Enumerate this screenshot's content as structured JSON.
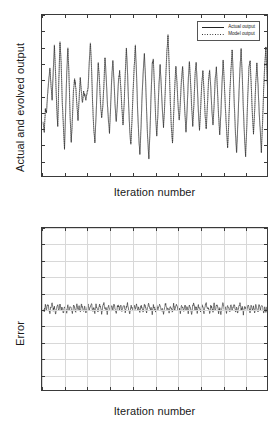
{
  "figure": {
    "background": "#ffffff",
    "axis_color": "#3a3a3a",
    "grid_color": "#d8d8d8",
    "line_color": "#222222"
  },
  "legend": {
    "entries": [
      {
        "label": "Actual output",
        "style": "solid"
      },
      {
        "label": "Model output",
        "style": "dotted"
      }
    ]
  },
  "chart_data": [
    {
      "type": "line",
      "id": "actual-vs-model",
      "title": "",
      "xlabel": "Iteration number",
      "ylabel": "Actual and evolved output",
      "xlim": [
        0,
        200
      ],
      "ylim": [
        -1,
        1
      ],
      "grid": false,
      "legend_position": "top-right",
      "xticks": [
        0,
        20,
        40,
        60,
        80,
        100,
        120,
        140,
        160,
        180,
        200
      ],
      "xtick_labels": [
        "0",
        "20",
        "40",
        "60",
        "80",
        "100",
        "120",
        "140",
        "160",
        "180",
        "200"
      ],
      "yticks": [
        1,
        0.8,
        0.6,
        0.4,
        0.2,
        0,
        -0.2,
        -0.4,
        -0.6,
        -0.8,
        -1
      ],
      "ytick_labels": [
        "1",
        "0.8",
        "0.6",
        "0.4",
        "0.2",
        "0",
        "-0.2",
        "-0.4",
        "-0.6",
        "-0.8",
        "-1"
      ],
      "series": [
        {
          "name": "Actual output",
          "style": "solid",
          "x_start": 1,
          "x_step": 1,
          "values": [
            -0.32,
            -0.46,
            -0.18,
            -0.21,
            0.02,
            0.18,
            0.35,
            0.12,
            -0.05,
            0.3,
            0.62,
            0.3,
            -0.12,
            -0.4,
            0.2,
            0.66,
            0.42,
            -0.08,
            -0.38,
            -0.66,
            -0.2,
            0.28,
            0.6,
            0.24,
            -0.26,
            -0.58,
            -0.3,
            0.06,
            0.2,
            0.1,
            -0.12,
            -0.3,
            -0.05,
            0.22,
            0.05,
            -0.1,
            0.04,
            0.0,
            -0.06,
            0.02,
            0.1,
            0.4,
            0.66,
            0.36,
            -0.1,
            -0.42,
            -0.58,
            -0.28,
            0.1,
            0.4,
            0.2,
            -0.1,
            -0.28,
            -0.14,
            0.12,
            0.48,
            0.24,
            -0.06,
            -0.3,
            -0.46,
            -0.14,
            0.22,
            0.44,
            0.18,
            -0.14,
            -0.34,
            -0.1,
            0.18,
            0.3,
            0.1,
            -0.16,
            -0.36,
            -0.12,
            0.26,
            0.58,
            0.3,
            -0.12,
            -0.44,
            -0.62,
            -0.3,
            0.06,
            0.36,
            0.62,
            0.28,
            -0.18,
            -0.52,
            -0.74,
            -0.4,
            0.0,
            0.3,
            0.52,
            0.22,
            -0.2,
            -0.56,
            -0.78,
            -0.44,
            0.02,
            0.4,
            0.44,
            0.1,
            -0.26,
            -0.52,
            -0.24,
            0.14,
            0.38,
            0.12,
            -0.18,
            -0.4,
            -0.14,
            0.22,
            0.54,
            0.74,
            0.4,
            -0.06,
            -0.4,
            -0.6,
            -0.26,
            0.1,
            0.36,
            0.16,
            -0.14,
            -0.32,
            -0.08,
            0.2,
            0.36,
            0.08,
            -0.22,
            -0.46,
            -0.18,
            0.18,
            0.42,
            0.18,
            -0.14,
            -0.38,
            -0.12,
            0.24,
            0.4,
            0.14,
            -0.2,
            -0.44,
            -0.16,
            0.14,
            0.3,
            0.06,
            -0.24,
            -0.42,
            -0.14,
            0.18,
            0.32,
            0.1,
            -0.18,
            -0.38,
            -0.12,
            0.22,
            0.34,
            0.06,
            -0.26,
            -0.5,
            -0.22,
            0.14,
            0.44,
            0.18,
            -0.16,
            -0.42,
            -0.66,
            -0.34,
            0.04,
            0.32,
            0.56,
            0.26,
            -0.14,
            -0.48,
            -0.72,
            -0.38,
            0.0,
            0.34,
            0.58,
            0.24,
            -0.18,
            -0.52,
            -0.76,
            -0.4,
            0.02,
            0.36,
            0.44,
            0.12,
            -0.24,
            -0.48,
            -0.2,
            0.16,
            0.4,
            0.14,
            -0.2,
            -0.44,
            -0.7,
            -0.36,
            0.06,
            0.38,
            0.6,
            0.26,
            -0.1,
            -0.44,
            -0.24,
            0.12,
            0.3,
            0.08,
            -0.22,
            -0.4,
            -0.12,
            0.2,
            0.38,
            0.1,
            -0.18,
            -0.46,
            -0.18,
            0.22,
            0.52,
            0.7,
            0.36,
            -0.04,
            -0.36,
            -0.56,
            -0.24,
            0.1,
            0.28,
            0.06,
            -0.2,
            -0.38,
            -0.1,
            0.18,
            0.3,
            0.04,
            -0.24,
            -0.44,
            -0.16,
            0.2,
            0.34,
            0.08,
            -0.18,
            -0.4,
            -0.14,
            0.16,
            0.26,
            0.02,
            -0.26,
            -0.46,
            -0.2,
            0.18,
            0.4,
            0.22,
            -0.02,
            -0.3,
            -0.18,
            0.12,
            0.26,
            0.18,
            0.08,
            0.2,
            0.14,
            -0.22
          ]
        },
        {
          "name": "Model output",
          "style": "dotted",
          "note": "overlaps the actual output trace almost exactly; difference shown in the Error panel"
        }
      ]
    },
    {
      "type": "line",
      "id": "error",
      "title": "",
      "xlabel": "Iteration number",
      "ylabel": "Error",
      "xlim": [
        0,
        200
      ],
      "ylim": [
        -0.05,
        0.05
      ],
      "grid": true,
      "xticks": [
        0,
        20,
        40,
        60,
        80,
        100,
        120,
        140,
        160,
        180,
        200
      ],
      "xtick_labels": [
        "0",
        "20",
        "40",
        "60",
        "80",
        "100",
        "120",
        "140",
        "160",
        "180",
        "200"
      ],
      "yticks": [
        0.05,
        0.04,
        0.03,
        0.02,
        0.01,
        0,
        -0.01,
        -0.02,
        -0.03,
        -0.04,
        -0.05
      ],
      "ytick_labels": [
        "0.05",
        "0.04",
        "0.03",
        "0.02",
        "0.01",
        "0",
        "-0.01",
        "-0.02",
        "-0.03",
        "-0.04",
        "-0.05"
      ],
      "series": [
        {
          "name": "Error",
          "style": "solid",
          "x_start": 1,
          "x_step": 1,
          "values": [
            0.0005,
            -0.0012,
            0.0022,
            -0.0008,
            0.0031,
            0.0006,
            -0.0025,
            0.0014,
            0.0037,
            -0.0006,
            0.0019,
            -0.003,
            0.0008,
            0.0026,
            -0.0014,
            0.0034,
            -0.0004,
            0.0012,
            -0.0028,
            0.0018,
            0.0006,
            -0.002,
            0.003,
            -0.001,
            0.0016,
            0.0002,
            -0.0026,
            0.0022,
            0.0008,
            -0.0018,
            0.0028,
            -0.0006,
            0.0014,
            -0.0024,
            0.0032,
            0.0004,
            -0.0016,
            0.002,
            -0.003,
            0.001,
            0.0024,
            -0.0008,
            0.0016,
            0.0034,
            -0.0012,
            0.0006,
            -0.0022,
            0.0026,
            0.0,
            -0.0018,
            0.003,
            0.0012,
            -0.0026,
            0.0018,
            0.0038,
            -0.0004,
            0.001,
            -0.003,
            0.0022,
            0.0006,
            -0.0016,
            0.0028,
            -0.001,
            0.0034,
            0.0002,
            -0.0024,
            0.0014,
            0.002,
            -0.0008,
            0.003,
            -0.0014,
            0.0006,
            0.0026,
            -0.002,
            0.001,
            0.0036,
            -0.0002,
            -0.0028,
            0.0018,
            0.0008,
            -0.0016,
            0.0024,
            -0.0006,
            0.0032,
            -0.0012,
            0.0014,
            -0.0026,
            0.002,
            0.0004,
            -0.0018,
            0.0028,
            0.001,
            -0.0022,
            0.0016,
            0.0034,
            -0.0008,
            0.0006,
            -0.003,
            0.0024,
            0.0002,
            -0.0014,
            0.003,
            -0.0004,
            0.0018,
            0.0026,
            -0.002,
            0.0008,
            -0.0028,
            0.0016,
            0.0036,
            -0.0006,
            0.0012,
            -0.0024,
            0.0022,
            0.0,
            -0.0016,
            0.0032,
            -0.001,
            0.0014,
            0.0028,
            -0.0018,
            0.0006,
            -0.0026,
            0.002,
            0.001,
            -0.0012,
            0.003,
            -0.0002,
            0.0016,
            -0.0022,
            0.0024,
            0.0004,
            -0.003,
            0.0018,
            0.0034,
            -0.0008,
            0.0012,
            -0.002,
            0.0026,
            0.0,
            -0.0016,
            0.0028,
            0.0008,
            -0.0024,
            0.002,
            0.0036,
            -0.0004,
            0.001,
            -0.0028,
            0.0022,
            0.0006,
            -0.0014,
            0.0032,
            -0.001,
            0.0018,
            0.0026,
            -0.0022,
            0.0008,
            -0.003,
            0.0014,
            0.0038,
            -0.0002,
            0.0012,
            -0.0026,
            0.0024,
            0.0004,
            -0.0018,
            0.003,
            -0.0008,
            0.0016,
            0.0028,
            -0.002,
            0.0006,
            -0.0024,
            0.002,
            0.0034,
            -0.0006,
            0.001,
            -0.003,
            0.0018,
            0.0002,
            -0.0016,
            0.0026,
            0.0008,
            -0.0022,
            0.003,
            -0.0004,
            0.0014,
            -0.0028,
            0.0022,
            0.0006,
            -0.0012,
            0.0032,
            -0.001,
            0.0016,
            0.0024,
            -0.0026,
            0.0008,
            -0.0018,
            0.0012
          ]
        }
      ]
    }
  ]
}
